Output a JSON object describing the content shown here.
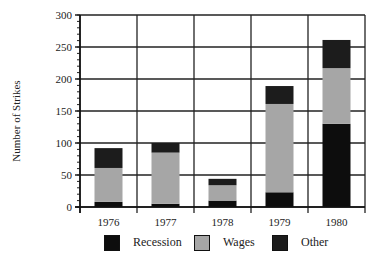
{
  "chart_data": {
    "type": "bar",
    "stacked": true,
    "title": "",
    "xlabel": "",
    "ylabel": "Number of Strikes",
    "ylim": [
      0,
      300
    ],
    "yticks": [
      0,
      50,
      100,
      150,
      200,
      250,
      300
    ],
    "grid": true,
    "legend_position": "bottom",
    "categories": [
      "1976",
      "1977",
      "1978",
      "1979",
      "1980"
    ],
    "series": [
      {
        "name": "Recession",
        "color": "#0d0d0d",
        "values": [
          8,
          5,
          10,
          23,
          130
        ]
      },
      {
        "name": "Wages",
        "color": "#a6a6a6",
        "values": [
          53,
          80,
          24,
          138,
          87
        ]
      },
      {
        "name": "Other",
        "color": "#1c1c1c",
        "values": [
          31,
          15,
          10,
          28,
          44
        ]
      }
    ],
    "totals": [
      92,
      100,
      44,
      189,
      261
    ]
  },
  "axis": {
    "ylabel": "Number of Strikes",
    "ytick_labels": [
      "0",
      "50",
      "100",
      "150",
      "200",
      "250",
      "300"
    ],
    "xtick_labels": [
      "1976",
      "1977",
      "1978",
      "1979",
      "1980"
    ]
  },
  "legend": {
    "items": [
      {
        "label": "Recession",
        "color": "#0d0d0d"
      },
      {
        "label": "Wages",
        "color": "#a6a6a6"
      },
      {
        "label": "Other",
        "color": "#1c1c1c"
      }
    ]
  }
}
